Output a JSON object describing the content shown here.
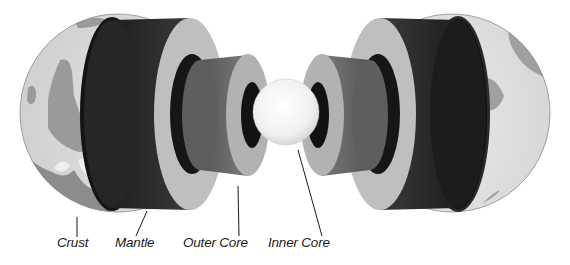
{
  "figure": {
    "layers": [
      {
        "id": "crust",
        "label": "Crust"
      },
      {
        "id": "mantle",
        "label": "Mantle"
      },
      {
        "id": "outer_core",
        "label": "Outer Core"
      },
      {
        "id": "inner_core",
        "label": "Inner Core"
      }
    ],
    "colors": {
      "background": "#ffffff",
      "ocean_surface": "#e6e6e6",
      "continent": "#9a9a9a",
      "crust_inner": "#141414",
      "mantle_side": "#2a2a2a",
      "mantle_face": "#bdbdbd",
      "outer_core_side": "#6e6e6e",
      "outer_core_face": "#b0b0b0",
      "inner_core": "#f4f4f4",
      "line": "#1a1a1a"
    }
  }
}
